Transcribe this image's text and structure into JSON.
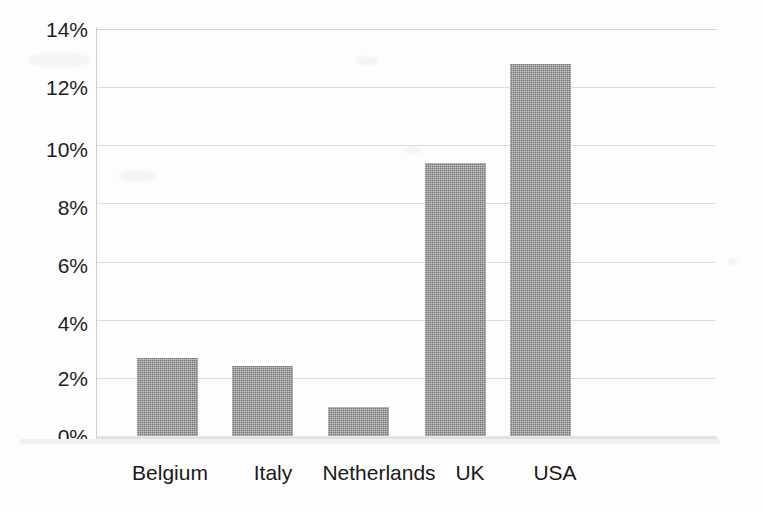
{
  "chart_data": {
    "type": "bar",
    "title": "",
    "subtitle": "",
    "xlabel": "",
    "ylabel": "",
    "categories": [
      "Belgium",
      "Italy",
      "Netherlands",
      "UK",
      "USA"
    ],
    "values": [
      2.7,
      2.4,
      1.0,
      9.4,
      12.8
    ],
    "value_unit": "%",
    "ylim": [
      0,
      14
    ],
    "ytick_labels": [
      "0%",
      "2%",
      "4%",
      "6%",
      "8%",
      "10%",
      "12%",
      "14%"
    ],
    "ytick_values": [
      0,
      2,
      4,
      6,
      8,
      10,
      12,
      14
    ],
    "grid": true,
    "grid_axis": "y",
    "legend": false,
    "legend_position": "none",
    "series": [
      {
        "name": "",
        "values": [
          2.7,
          2.4,
          1.0,
          9.4,
          12.8
        ]
      }
    ],
    "colors": {
      "bar_fill": "#888888",
      "gridline": "#dcdcdc",
      "axis": "#cfcfcf",
      "text": "#1d1d1d",
      "background": "#fdfdfd"
    },
    "annotations": []
  },
  "axis": {
    "y_ticks": [
      {
        "label": "14%",
        "value": 14
      },
      {
        "label": "12%",
        "value": 12
      },
      {
        "label": "10%",
        "value": 10
      },
      {
        "label": "8%",
        "value": 8
      },
      {
        "label": "6%",
        "value": 6
      },
      {
        "label": "4%",
        "value": 4
      },
      {
        "label": "2%",
        "value": 2
      },
      {
        "label": "0%",
        "value": 0
      }
    ],
    "x_ticks": [
      {
        "label": "Belgium"
      },
      {
        "label": "Italy"
      },
      {
        "label": "Netherlands"
      },
      {
        "label": "UK"
      },
      {
        "label": "USA"
      }
    ]
  },
  "bars": [
    {
      "label": "Belgium",
      "value": 2.7,
      "value_text": "2.7%"
    },
    {
      "label": "Italy",
      "value": 2.4,
      "value_text": "2.4%"
    },
    {
      "label": "Netherlands",
      "value": 1.0,
      "value_text": "1.0%"
    },
    {
      "label": "UK",
      "value": 9.4,
      "value_text": "9.4%"
    },
    {
      "label": "USA",
      "value": 12.8,
      "value_text": "12.8%"
    }
  ]
}
